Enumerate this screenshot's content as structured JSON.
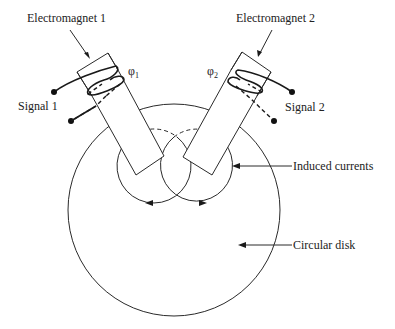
{
  "diagram": {
    "labels": {
      "electromagnet_1": "Electromagnet 1",
      "electromagnet_2": "Electromagnet 2",
      "signal_1": "Signal 1",
      "signal_2": "Signal 2",
      "flux_1_symbol": "φ",
      "flux_1_subscript": "1",
      "flux_2_symbol": "φ",
      "flux_2_subscript": "2",
      "induced_currents": "Induced currents",
      "circular_disk": "Circular disk"
    },
    "colors": {
      "line": "#2a2a2a",
      "text": "#222222",
      "background": "#ffffff"
    }
  }
}
